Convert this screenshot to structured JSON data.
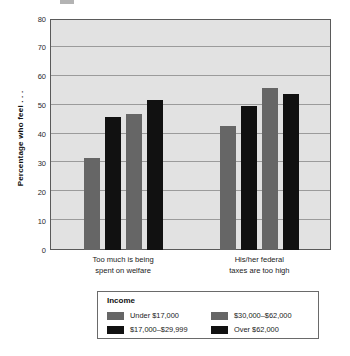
{
  "chart_data": {
    "type": "bar",
    "title": "",
    "subtitle": "",
    "xlabel": "",
    "ylabel": "Percentage who feel . . .",
    "ylim": [
      0,
      80
    ],
    "yticks": [
      0,
      10,
      20,
      30,
      40,
      50,
      60,
      70,
      80
    ],
    "grid": true,
    "legend_position": "bottom",
    "legend_title": "Income",
    "categories": [
      "Too much is being spent on welfare",
      "His/her federal taxes are too high"
    ],
    "category_lines": [
      [
        "Too much is being",
        "spent on welfare"
      ],
      [
        "His/her federal",
        "taxes are too high"
      ]
    ],
    "series": [
      {
        "name": "Under $17,000",
        "color": "#666666",
        "values": [
          32,
          43
        ]
      },
      {
        "name": "$17,000–$29,999",
        "color": "#111111",
        "values": [
          46,
          50
        ]
      },
      {
        "name": "$30,000–$62,000",
        "color": "#666666",
        "values": [
          47,
          56
        ]
      },
      {
        "name": "Over $62,000",
        "color": "#111111",
        "values": [
          52,
          54
        ]
      }
    ]
  },
  "legend": {
    "title": "Income",
    "entries": [
      {
        "label": "Under $17,000",
        "color": "#666666"
      },
      {
        "label": "$30,000–$62,000",
        "color": "#666666"
      },
      {
        "label": "$17,000–$29,999",
        "color": "#111111"
      },
      {
        "label": "Over $62,000",
        "color": "#111111"
      }
    ]
  },
  "colors": {
    "plot_background": "#e2e2e2",
    "gridline": "#9b9b9b",
    "frame": "#5a5a5a",
    "bar_gray": "#666666",
    "bar_black": "#111111",
    "page_background": "#ffffff"
  }
}
